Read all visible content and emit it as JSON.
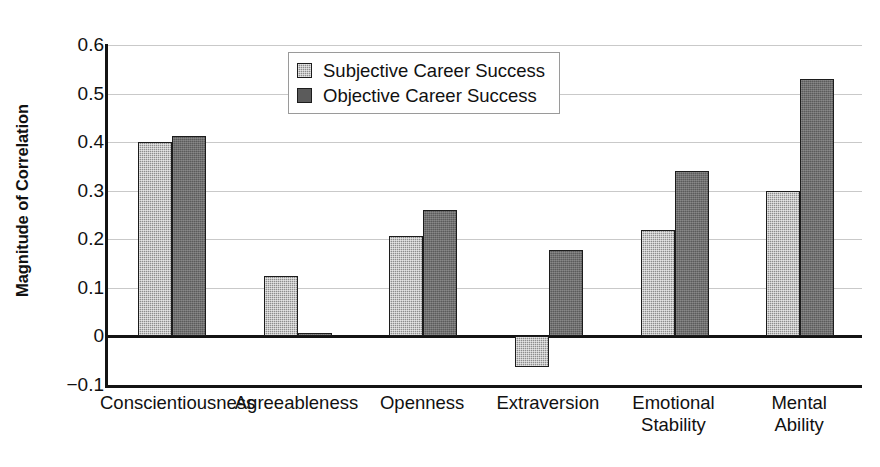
{
  "chart_data": {
    "type": "bar",
    "title": "",
    "xlabel": "",
    "ylabel": "Magnitude of Correlation",
    "ylim": [
      -0.1,
      0.6
    ],
    "ytick_labels": [
      "0.6",
      "0.5",
      "0.4",
      "0.3",
      "0.2",
      "0.1",
      "0",
      "−0.1"
    ],
    "ytick_values": [
      0.6,
      0.5,
      0.4,
      0.3,
      0.2,
      0.1,
      0,
      -0.1
    ],
    "grid": true,
    "legend_position": "top-center",
    "categories": [
      "Conscientiousness",
      "Agreeableness",
      "Openness",
      "Extraversion",
      "Emotional\nStability",
      "Mental\nAbility"
    ],
    "series": [
      {
        "name": "Subjective Career Success",
        "color": "#8d8d8d",
        "values": [
          0.4,
          0.125,
          0.207,
          -0.062,
          0.22,
          0.3
        ]
      },
      {
        "name": "Objective Career Success",
        "color": "#5b5b5b",
        "values": [
          0.412,
          0.008,
          0.26,
          0.178,
          0.34,
          0.53
        ]
      }
    ]
  },
  "legend": {
    "entries": [
      {
        "label": "Subjective Career Success",
        "swatch": "subjective"
      },
      {
        "label": "Objective Career Success",
        "swatch": "objective"
      }
    ]
  },
  "axes": {
    "y_title": "Magnitude of Correlation"
  }
}
